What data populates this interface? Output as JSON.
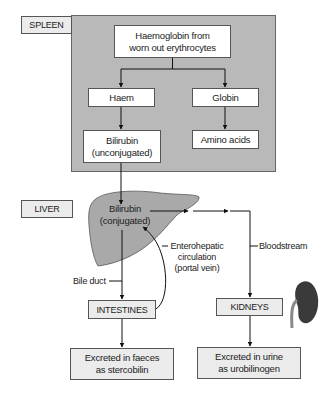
{
  "sections": {
    "spleen": "SPLEEN",
    "liver": "LIVER"
  },
  "spleen_nodes": {
    "haemoglobin": "Haemoglobin from worn out erythrocytes",
    "haemoglobin_line1": "Haemoglobin from",
    "haemoglobin_line2": "worn out erythrocytes",
    "haem": "Haem",
    "globin": "Globin",
    "bilirubin_unconj_line1": "Bilirubin",
    "bilirubin_unconj_line2": "(unconjugated)",
    "amino_acids": "Amino acids"
  },
  "liver_nodes": {
    "bilirubin_conj_line1": "Bilirubin",
    "bilirubin_conj_line2": "(conjugated)"
  },
  "pathway_labels": {
    "enterohepatic_line1": "Enterohepatic",
    "enterohepatic_line2": "circulation",
    "enterohepatic_line3": "(portal vein)",
    "bloodstream": "Bloodstream",
    "bile_duct": "Bile duct"
  },
  "organs": {
    "intestines": "INTESTINES",
    "kidneys": "KIDNEYS"
  },
  "outputs": {
    "faeces_line1": "Excreted in faeces",
    "faeces_line2": "as stercobilin",
    "urine_line1": "Excreted in urine",
    "urine_line2": "as urobilinogen"
  },
  "colors": {
    "spleen_panel": "#b9b9b9",
    "liver_fill": "#a9a9a9",
    "kidney_fill": "#3a3a3a",
    "box_light": "#ebebeb",
    "line": "#111111"
  }
}
